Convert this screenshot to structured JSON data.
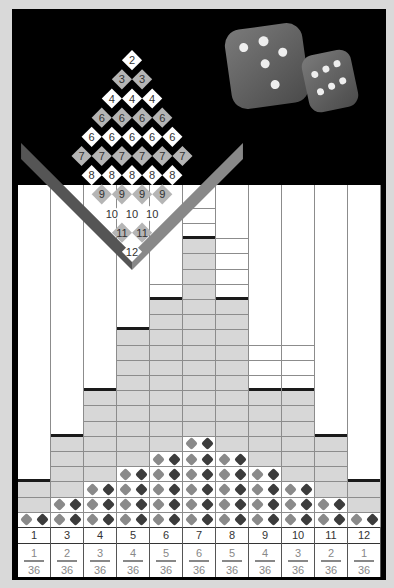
{
  "board": {
    "rows": [
      [
        "2"
      ],
      [
        "3",
        "3"
      ],
      [
        "4",
        "4",
        "4"
      ],
      [
        "6",
        "6",
        "6",
        "6"
      ],
      [
        "6",
        "6",
        "6",
        "6",
        "6"
      ],
      [
        "7",
        "7",
        "7",
        "7",
        "7",
        "7"
      ],
      [
        "8",
        "8",
        "8",
        "8",
        "8"
      ],
      [
        "9",
        "9",
        "9",
        "9"
      ],
      [
        "10",
        "10",
        "10"
      ],
      [
        "11",
        "11"
      ],
      [
        "12"
      ]
    ]
  },
  "dice_icons": [
    "die-five",
    "die-six"
  ],
  "colors": {
    "frame": "#000000",
    "background": "#d9d9d9",
    "bar_fill": "#d7d7d7",
    "grid_line": "#8c8c8c",
    "die_light": "#8a8a8a",
    "die_dark": "#3c3c3c"
  },
  "chart_data": {
    "type": "bar",
    "title": "",
    "xlabel": "Sum of two dice",
    "ylabel": "",
    "categories": [
      "1",
      "3",
      "4",
      "5",
      "6",
      "7",
      "8",
      "9",
      "10",
      "11",
      "12"
    ],
    "probabilities": [
      "1/36",
      "2/36",
      "3/36",
      "4/36",
      "5/36",
      "6/36",
      "5/36",
      "4/36",
      "3/36",
      "2/36",
      "1/36"
    ],
    "series": [
      {
        "name": "dice combinations (rows)",
        "values": [
          1,
          2,
          3,
          4,
          5,
          6,
          5,
          4,
          3,
          2,
          1
        ]
      },
      {
        "name": "filled bar height (rows)",
        "values": [
          3,
          6,
          9,
          13,
          15,
          19,
          15,
          9,
          9,
          6,
          3
        ]
      }
    ]
  },
  "columns": [
    {
      "sum": "1",
      "num": "1",
      "den": "36"
    },
    {
      "sum": "3",
      "num": "2",
      "den": "36"
    },
    {
      "sum": "4",
      "num": "3",
      "den": "36"
    },
    {
      "sum": "5",
      "num": "4",
      "den": "36"
    },
    {
      "sum": "6",
      "num": "5",
      "den": "36"
    },
    {
      "sum": "7",
      "num": "6",
      "den": "36"
    },
    {
      "sum": "8",
      "num": "5",
      "den": "36"
    },
    {
      "sum": "9",
      "num": "4",
      "den": "36"
    },
    {
      "sum": "10",
      "num": "3",
      "den": "36"
    },
    {
      "sum": "11",
      "num": "2",
      "den": "36"
    },
    {
      "sum": "12",
      "num": "1",
      "den": "36"
    }
  ]
}
